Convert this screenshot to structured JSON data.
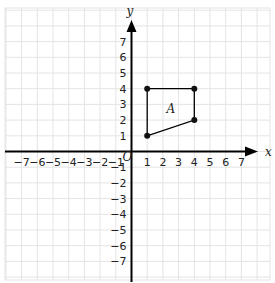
{
  "header_text": "",
  "chart_data": {
    "type": "coordinate-plane",
    "x_axis": {
      "label": "x",
      "min": -7,
      "max": 7,
      "ticks": [
        -7,
        -6,
        -5,
        -4,
        -3,
        -2,
        -1,
        1,
        2,
        3,
        4,
        5,
        6,
        7
      ]
    },
    "y_axis": {
      "label": "y",
      "min": -7,
      "max": 7,
      "ticks": [
        7,
        6,
        5,
        4,
        3,
        2,
        1,
        -1,
        -2,
        -3,
        -4,
        -5,
        -6,
        -7
      ]
    },
    "origin_label": "O",
    "grid": true,
    "shapes": [
      {
        "name": "A",
        "label": "A",
        "vertices": [
          [
            1,
            4
          ],
          [
            4,
            4
          ],
          [
            4,
            2
          ],
          [
            1,
            1
          ]
        ],
        "label_pos": [
          2.5,
          2.7
        ]
      }
    ]
  },
  "colors": {
    "grid": "#e4e4e4",
    "axis": "#000000",
    "shape": "#000000",
    "point": "#111111"
  }
}
